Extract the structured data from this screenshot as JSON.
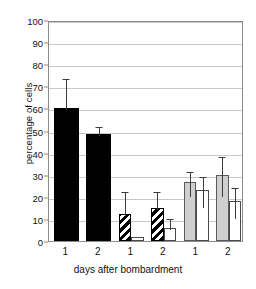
{
  "chart_data": {
    "type": "bar",
    "title": "",
    "xlabel": "days after bombardment",
    "ylabel": "percentage of cells",
    "ylim": [
      0,
      100
    ],
    "ytick_step": 10,
    "yticks": [
      0,
      10,
      20,
      30,
      40,
      50,
      60,
      70,
      80,
      90,
      100
    ],
    "grid": true,
    "legend": "none",
    "categories": [
      "1",
      "2",
      "1",
      "2",
      "1",
      "2"
    ],
    "group_labels": [
      "1",
      "2",
      "1",
      "2",
      "1",
      "2"
    ],
    "bars": [
      {
        "group": 1,
        "day": "1",
        "style": "black",
        "value": 60.0,
        "error": 14.0,
        "err_low": 60.0,
        "err_high": 74.0
      },
      {
        "group": 1,
        "day": "2",
        "style": "black",
        "value": 48.5,
        "error": 4.0,
        "err_low": 48.5,
        "err_high": 52.5
      },
      {
        "group": 2,
        "day": "1",
        "style": "hatch",
        "value": 12.0,
        "error": 11.0,
        "err_low": 12.0,
        "err_high": 23.0
      },
      {
        "group": 2,
        "day": "1",
        "style": "white",
        "value": 2.0,
        "error": 0.0,
        "err_low": 2.0,
        "err_high": 2.0
      },
      {
        "group": 2,
        "day": "2",
        "style": "hatch",
        "value": 15.0,
        "error": 8.0,
        "err_low": 15.0,
        "err_high": 23.0
      },
      {
        "group": 2,
        "day": "2",
        "style": "white",
        "value": 6.0,
        "error": 5.0,
        "err_low": 6.0,
        "err_high": 11.0
      },
      {
        "group": 3,
        "day": "1",
        "style": "gray",
        "value": 26.5,
        "error": 5.5,
        "err_low": 21.0,
        "err_high": 32.0
      },
      {
        "group": 3,
        "day": "1",
        "style": "white",
        "value": 23.0,
        "error": 7.0,
        "err_low": 16.0,
        "err_high": 30.0
      },
      {
        "group": 3,
        "day": "2",
        "style": "gray",
        "value": 30.0,
        "error": 9.0,
        "err_low": 21.0,
        "err_high": 39.0
      },
      {
        "group": 3,
        "day": "2",
        "style": "white",
        "value": 18.0,
        "error": 7.0,
        "err_low": 11.0,
        "err_high": 25.0
      }
    ],
    "colors": {
      "black": "#000000",
      "gray": "#cfcfcf",
      "white": "#ffffff",
      "hatch": "#000000",
      "axis": "#8c8c8c",
      "grid": "#c8c8c8",
      "error": "#3d3d3d"
    }
  }
}
